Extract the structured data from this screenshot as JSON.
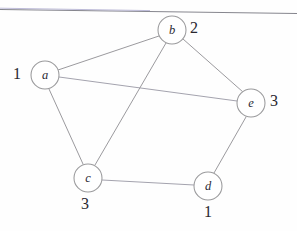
{
  "figure": {
    "type": "undirected-graph",
    "background_color": "#fefefe",
    "stroke_color": "#9a9a9c",
    "text_color": "#29272f",
    "top_rule": {
      "name": "horizontal-rule",
      "from_x": 0,
      "from_y": 9,
      "to_x": 297,
      "to_y": 14
    }
  },
  "nodes": [
    {
      "id": "a",
      "label": "a",
      "cx": 45,
      "cy": 75,
      "r": 14,
      "weight": "1",
      "weight_position": "left",
      "wx": 13,
      "wy": 66
    },
    {
      "id": "b",
      "label": "b",
      "cx": 172,
      "cy": 30,
      "r": 14,
      "weight": "2",
      "weight_position": "right",
      "wx": 190,
      "wy": 20
    },
    {
      "id": "c",
      "label": "c",
      "cx": 88,
      "cy": 178,
      "r": 14,
      "weight": "3",
      "weight_position": "below",
      "wx": 81,
      "wy": 196
    },
    {
      "id": "d",
      "label": "d",
      "cx": 208,
      "cy": 186,
      "r": 14,
      "weight": "1",
      "weight_position": "below",
      "wx": 204,
      "wy": 204
    },
    {
      "id": "e",
      "label": "e",
      "cx": 251,
      "cy": 103,
      "r": 14,
      "weight": "3",
      "weight_position": "right",
      "wx": 270,
      "wy": 93
    }
  ],
  "edges": [
    {
      "id": "ab",
      "from": "a",
      "to": "b",
      "x1": 58,
      "y1": 70,
      "x2": 159,
      "y2": 36
    },
    {
      "id": "ae",
      "from": "a",
      "to": "e",
      "x1": 59,
      "y1": 77,
      "x2": 237,
      "y2": 101
    },
    {
      "id": "ac",
      "from": "a",
      "to": "c",
      "x1": 49,
      "y1": 89,
      "x2": 83,
      "y2": 164
    },
    {
      "id": "bc",
      "from": "b",
      "to": "c",
      "x1": 166,
      "y1": 43,
      "x2": 95,
      "y2": 165
    },
    {
      "id": "be",
      "from": "b",
      "to": "e",
      "x1": 183,
      "y1": 39,
      "x2": 243,
      "y2": 92
    },
    {
      "id": "cd",
      "from": "c",
      "to": "d",
      "x1": 102,
      "y1": 180,
      "x2": 194,
      "y2": 185
    },
    {
      "id": "de",
      "from": "d",
      "to": "e",
      "x1": 214,
      "y1": 173,
      "x2": 246,
      "y2": 117
    }
  ]
}
